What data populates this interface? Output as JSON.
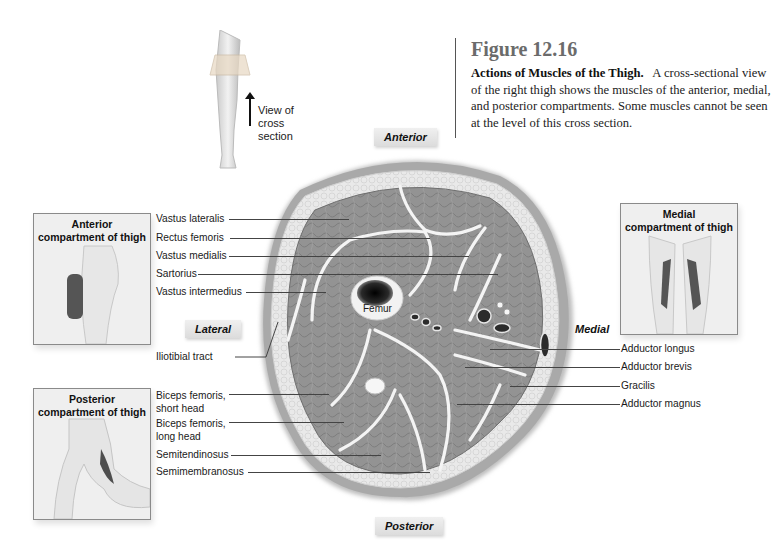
{
  "caption": {
    "figure_number": "Figure 12.16",
    "title": "Actions of Muscles of the Thigh.",
    "body": "A cross-sectional view of the right thigh shows the muscles of the anterior, medial, and posterior compartments. Some muscles cannot be seen at the level of this cross section."
  },
  "orientation_inset": {
    "label": "View of\ncross\nsection",
    "icon": "arrow-up-icon"
  },
  "directions": {
    "anterior": "Anterior",
    "posterior": "Posterior",
    "lateral": "Lateral",
    "medial": "Medial"
  },
  "compartments": {
    "anterior": "Anterior\ncompartment of thigh",
    "posterior": "Posterior\ncompartment of thigh",
    "medial": "Medial\ncompartment of thigh"
  },
  "center_label": "Femur",
  "left_labels": [
    "Vastus lateralis",
    "Rectus femoris",
    "Vastus medialis",
    "Sartorius",
    "Vastus intermedius",
    "Iliotibial tract",
    "Biceps femoris,\nshort head",
    "Biceps femoris,\nlong head",
    "Semitendinosus",
    "Semimembranosus"
  ],
  "right_labels": [
    "Adductor longus",
    "Adductor brevis",
    "Gracilis",
    "Adductor magnus"
  ],
  "colors": {
    "muscle": "#8e8e8e",
    "fat": "#e6e6e6",
    "skin": "#a5a5a5",
    "fascia": "#f5f5f5",
    "bone": "#1c1c1c"
  }
}
